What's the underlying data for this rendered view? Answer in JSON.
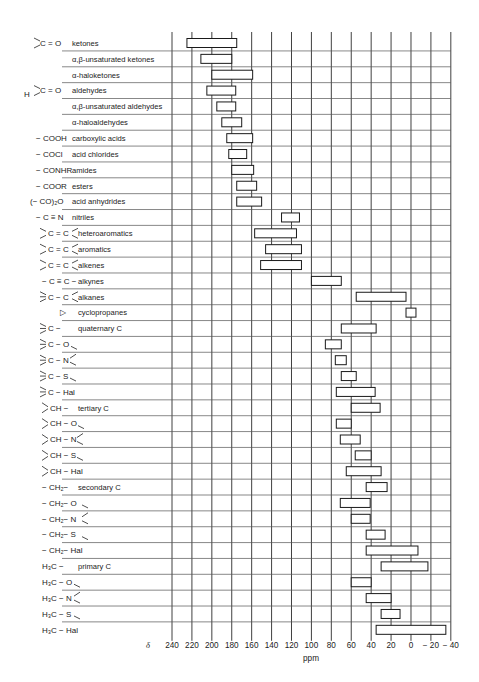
{
  "chart_data": {
    "type": "range-bar",
    "title": "",
    "xlabel": "ppm",
    "axis_symbol": "δ",
    "xlim": [
      240,
      -40
    ],
    "x_reversed": true,
    "grid": true,
    "xticks": [
      240,
      220,
      200,
      180,
      160,
      140,
      120,
      100,
      80,
      60,
      40,
      20,
      0,
      -20,
      -40
    ],
    "xtick_labels": [
      "240",
      "220",
      "200",
      "180",
      "160",
      "140",
      "120",
      "100",
      "80",
      "60",
      "40",
      "20",
      "0",
      "− 20",
      "− 40"
    ],
    "rows": [
      {
        "group": ">C=O",
        "name": "ketones",
        "range": [
          225,
          175
        ]
      },
      {
        "group": "",
        "name": "α,β-unsaturated ketones",
        "range": [
          211,
          180
        ]
      },
      {
        "group": "",
        "name": "α-haloketones",
        "range": [
          200,
          159
        ]
      },
      {
        "group": "H–C=O",
        "name": "aldehydes",
        "range": [
          205,
          176
        ]
      },
      {
        "group": "",
        "name": "α,β-unsaturated aldehydes",
        "range": [
          195,
          176
        ]
      },
      {
        "group": "",
        "name": "α-haloaldehydes",
        "range": [
          190,
          170
        ]
      },
      {
        "group": "− COOH",
        "name": "carboxylic acids",
        "range": [
          185,
          159
        ]
      },
      {
        "group": "− COCl",
        "name": "acid chlorides",
        "range": [
          183,
          165
        ]
      },
      {
        "group": "− CONHR",
        "name": "amides",
        "range": [
          180,
          158
        ]
      },
      {
        "group": "− COOR",
        "name": "esters",
        "range": [
          175,
          155
        ]
      },
      {
        "group": "(− CO)₂O",
        "name": "acid anhydrides",
        "range": [
          175,
          150
        ]
      },
      {
        "group": "− C ≡ N",
        "name": "nitriles",
        "range": [
          130,
          112
        ]
      },
      {
        "group": ">C = C<",
        "name": "heteroaromatics",
        "range": [
          157,
          115
        ]
      },
      {
        "group": ">C = C<",
        "name": "aromatics",
        "range": [
          146,
          110
        ]
      },
      {
        "group": ">C = C<",
        "name": "alkenes",
        "range": [
          151,
          110
        ]
      },
      {
        "group": "− C ≡ C −",
        "name": "alkynes",
        "range": [
          100,
          70
        ]
      },
      {
        "group": ">C − C<",
        "name": "alkanes",
        "range": [
          55,
          5
        ]
      },
      {
        "group": "▷",
        "name": "cyclopropanes",
        "range": [
          5,
          -5
        ]
      },
      {
        "group": ">C −",
        "name": "quaternary C",
        "range": [
          70,
          35
        ]
      },
      {
        "group": ">C − O",
        "name": "",
        "range": [
          86,
          70
        ]
      },
      {
        "group": ">C − N<",
        "name": "",
        "range": [
          76,
          65
        ]
      },
      {
        "group": ">C − S",
        "name": "",
        "range": [
          70,
          55
        ]
      },
      {
        "group": ">C − Hal",
        "name": "",
        "range": [
          75,
          36
        ]
      },
      {
        "group": ">CH −",
        "name": "tertiary C",
        "range": [
          60,
          31
        ]
      },
      {
        "group": ">CH − O",
        "name": "",
        "range": [
          75,
          60
        ]
      },
      {
        "group": ">CH − N<",
        "name": "",
        "range": [
          71,
          51
        ]
      },
      {
        "group": ">CH − S",
        "name": "",
        "range": [
          56,
          40
        ]
      },
      {
        "group": ">CH − Hal",
        "name": "",
        "range": [
          65,
          30
        ]
      },
      {
        "group": "− CH₂−",
        "name": "secondary C",
        "range": [
          45,
          24
        ]
      },
      {
        "group": "− CH₂− O",
        "name": "",
        "range": [
          71,
          41
        ]
      },
      {
        "group": "− CH₂− N<",
        "name": "",
        "range": [
          60,
          41
        ]
      },
      {
        "group": "− CH₂− S",
        "name": "",
        "range": [
          45,
          26
        ]
      },
      {
        "group": "− CH₂− Hal",
        "name": "",
        "range": [
          45,
          -7
        ]
      },
      {
        "group": "H₃C −",
        "name": "primary C",
        "range": [
          30,
          -17
        ]
      },
      {
        "group": "H₃C − O",
        "name": "",
        "range": [
          60,
          40
        ]
      },
      {
        "group": "H₃C − N<",
        "name": "",
        "range": [
          45,
          20
        ]
      },
      {
        "group": "H₃C − S",
        "name": "",
        "range": [
          30,
          11
        ]
      },
      {
        "group": "H₃C − Hal",
        "name": "",
        "range": [
          35,
          -35
        ]
      }
    ]
  },
  "labels": {
    "groups": [
      {
        "row": 0,
        "text": "C = O",
        "pre": ">",
        "x": 28
      },
      {
        "row": 3,
        "text": "C = O",
        "pre": "H>",
        "x": 28
      },
      {
        "row": 6,
        "text": "− COOH",
        "x": 24
      },
      {
        "row": 7,
        "text": "− COCl",
        "x": 24
      },
      {
        "row": 8,
        "text": "− CONHR",
        "x": 24
      },
      {
        "row": 9,
        "text": "− COOR",
        "x": 24
      },
      {
        "row": 10,
        "text": "(− CO)₂O",
        "x": 18
      },
      {
        "row": 11,
        "text": "− C ≡ N",
        "x": 24
      },
      {
        "row": 12,
        "text": "C = C",
        "x": 36
      },
      {
        "row": 13,
        "text": "C = C",
        "x": 36
      },
      {
        "row": 14,
        "text": "C = C",
        "x": 36
      },
      {
        "row": 15,
        "text": "− C ≡ C −",
        "x": 30
      },
      {
        "row": 16,
        "text": "C − C",
        "x": 36
      },
      {
        "row": 17,
        "text": "▷",
        "x": 48
      },
      {
        "row": 18,
        "text": "C −",
        "x": 36
      },
      {
        "row": 19,
        "text": "C − O",
        "x": 36
      },
      {
        "row": 20,
        "text": "C − N",
        "x": 36
      },
      {
        "row": 21,
        "text": "C − S",
        "x": 36
      },
      {
        "row": 22,
        "text": "C − Hal",
        "x": 36
      },
      {
        "row": 23,
        "text": "CH −",
        "x": 38
      },
      {
        "row": 24,
        "text": "CH − O",
        "x": 38
      },
      {
        "row": 25,
        "text": "CH − N",
        "x": 38
      },
      {
        "row": 26,
        "text": "CH − S",
        "x": 38
      },
      {
        "row": 27,
        "text": "CH − Hal",
        "x": 38
      },
      {
        "row": 28,
        "text": "− CH₂−",
        "x": 30
      },
      {
        "row": 29,
        "text": "− CH₂− O",
        "x": 30
      },
      {
        "row": 30,
        "text": "− CH₂− N",
        "x": 30
      },
      {
        "row": 31,
        "text": "− CH₂− S",
        "x": 30
      },
      {
        "row": 32,
        "text": "− CH₂− Hal",
        "x": 30
      },
      {
        "row": 33,
        "text": "H₃C −",
        "x": 30
      },
      {
        "row": 34,
        "text": "H₃C − O",
        "x": 30
      },
      {
        "row": 35,
        "text": "H₃C − N",
        "x": 30
      },
      {
        "row": 36,
        "text": "H₃C − S",
        "x": 30
      },
      {
        "row": 37,
        "text": "H₃C − Hal",
        "x": 30
      }
    ]
  }
}
